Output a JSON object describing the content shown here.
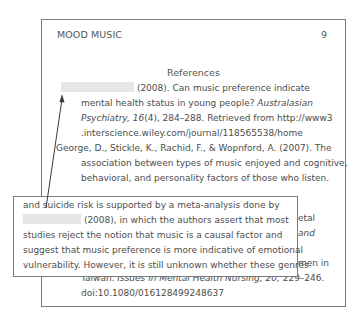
{
  "page": {
    "running_head": "MOOD MUSIC",
    "page_number": "9",
    "references_title": "References"
  },
  "references": [
    {
      "lines": [
        {
          "redacted": true,
          "text": "(2008). Can music preference indicate"
        },
        {
          "text": "mental health status in young people? ",
          "italic": "Australasian"
        },
        {
          "italic": "Psychiatry, 16",
          "text": "(4), 284–288. Retrieved from http://www3"
        },
        {
          "text": ".interscience.wiley.com/journal/118565538/home"
        }
      ]
    },
    {
      "lines": [
        {
          "text": "George, D., Stickle, K., Rachid, F., & Wopnford, A. (2007). The"
        },
        {
          "text": "association between types of music enjoyed and cognitive,"
        },
        {
          "text": "behavioral, and personality factors of those who listen."
        }
      ]
    },
    {
      "hidden_partial": [
        {
          "text": "etal"
        },
        {
          "italic": "and"
        },
        {
          "text": "men in"
        }
      ],
      "lines": [
        {
          "text": "Taiwan. ",
          "italic": "Issues in Mental Health Nursing, 20,",
          "text2": " 229–246."
        },
        {
          "text": "doi:10.1080/016128499248637"
        }
      ]
    }
  ],
  "overlay": {
    "lines": [
      {
        "text": "and suicide risk is supported by a meta-analysis done by"
      },
      {
        "redacted": true,
        "text": "(2008), in which the authors assert that most"
      },
      {
        "text": "studies reject the notion that music is a causal factor and"
      },
      {
        "text": "suggest that music preference is more indicative of emotional"
      },
      {
        "text": "vulnerability. However, it is still unknown whether these genres"
      }
    ]
  },
  "colors": {
    "border": "#7a7a7a",
    "text": "#4d4d4d",
    "redaction": "#e6e6e6"
  }
}
